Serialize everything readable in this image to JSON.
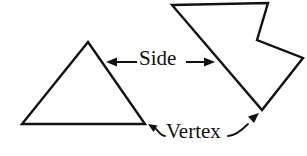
{
  "figure": {
    "background_color": "#ffffff",
    "ink_color": "#111111",
    "width": 307,
    "height": 156
  },
  "labels": {
    "side": "Side",
    "vertex": "Vertex"
  },
  "shapes": [
    {
      "name": "triangle",
      "kind": "convex-polygon",
      "vertex_count": 3,
      "points": "88,42 145,124 22,124"
    },
    {
      "name": "concave-polygon",
      "kind": "concave-polygon",
      "vertex_count": 6,
      "points": "172,5 268,3 257,40 303,58 262,110 172,5"
    }
  ],
  "annotations": {
    "side_pointer_left": {
      "icon": "arrow-left-icon",
      "from": "137,62",
      "to": "108,62"
    },
    "side_pointer_right": {
      "icon": "arrow-right-icon",
      "from": "186,62",
      "to": "214,62"
    },
    "vertex_pointer_left": {
      "icon": "curved-arrow-up-left-icon",
      "target_shape": "triangle",
      "target_point": "145,124"
    },
    "vertex_pointer_right": {
      "icon": "curved-arrow-up-right-icon",
      "target_shape": "concave-polygon",
      "target_point": "262,110"
    }
  }
}
